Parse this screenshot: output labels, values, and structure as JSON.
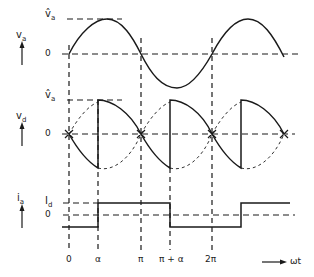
{
  "figure": {
    "type": "waveform-diagram",
    "panels": [
      {
        "id": "va",
        "ylabel": "v_a",
        "peak_label": "v̂_a",
        "zero_label": "0"
      },
      {
        "id": "vd",
        "ylabel": "v_d",
        "peak_label": "v̂_a",
        "zero_label": "0"
      },
      {
        "id": "ia",
        "ylabel": "i_a",
        "level_label": "I_d",
        "zero_label": "0"
      }
    ],
    "x_ticks": [
      "0",
      "α",
      "π",
      "π + α",
      "2π"
    ],
    "x_axis_label": "ωt"
  },
  "labels": {
    "va_axis": "v",
    "va_sub": "a",
    "va_peak": "v̂",
    "va_peak_sub": "a",
    "va_zero": "0",
    "vd_axis": "v",
    "vd_sub": "d",
    "vd_peak": "v̂",
    "vd_peak_sub": "a",
    "vd_zero": "0",
    "ia_axis": "i",
    "ia_sub": "a",
    "ia_level": "I",
    "ia_level_sub": "d",
    "ia_zero": "0",
    "tick_0": "0",
    "tick_alpha": "α",
    "tick_pi": "π",
    "tick_pi_alpha": "π + α",
    "tick_2pi": "2π",
    "x_axis": "ωt"
  },
  "colors": {
    "line": "#1a1a1a",
    "background": "#ffffff"
  }
}
